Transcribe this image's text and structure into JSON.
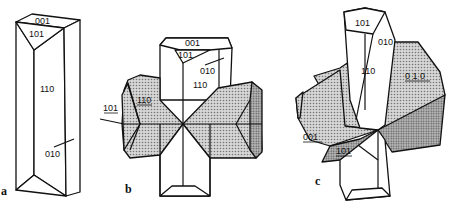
{
  "figure": {
    "panels": [
      {
        "id": "a",
        "label": "a",
        "faces": [
          "001",
          "101",
          "110",
          "010"
        ]
      },
      {
        "id": "b",
        "label": "b",
        "faces": [
          "001",
          "101",
          "010",
          "110",
          "110",
          "101"
        ],
        "underlined_faces": [
          "110",
          "101"
        ]
      },
      {
        "id": "c",
        "label": "c",
        "faces": [
          "101",
          "010",
          "110",
          "010",
          "001",
          "101"
        ],
        "underlined_faces": [
          "010",
          "001",
          "101"
        ]
      }
    ],
    "labels": {
      "a_001": "001",
      "a_101": "101",
      "a_110": "110",
      "a_010": "010",
      "b_001": "001",
      "b_101": "101",
      "b_010": "010",
      "b_110_top": "110",
      "b_110_left": "110",
      "b_101_left": "101",
      "c_101_top": "101",
      "c_010_edge": "010",
      "c_110": "110",
      "c_010_shaded": "0 1 0",
      "c_001": "001",
      "c_101_shaded": "101",
      "panel_a": "a",
      "panel_b": "b",
      "panel_c": "c"
    },
    "colors": {
      "line": "#111111",
      "shade": "#bdbdbd",
      "background": "#ffffff"
    }
  }
}
